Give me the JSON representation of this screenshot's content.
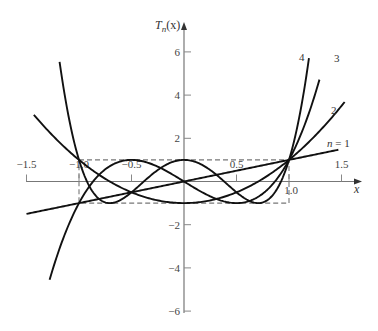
{
  "chart_data": {
    "type": "line",
    "title": "",
    "xlabel": "x",
    "ylabel": "T_n(x)",
    "xlim": [
      -1.5,
      1.5
    ],
    "ylim": [
      -6,
      6
    ],
    "grid": false,
    "x_ticks": [
      {
        "value": -1.5,
        "label": "−1.5"
      },
      {
        "value": -1.0,
        "label": "−1.0"
      },
      {
        "value": -0.5,
        "label": "−0.5"
      },
      {
        "value": 0.5,
        "label": "0.5"
      },
      {
        "value": 1.0,
        "label": "1.0"
      },
      {
        "value": 1.5,
        "label": "1.5"
      }
    ],
    "y_ticks": [
      {
        "value": 6,
        "label": "6"
      },
      {
        "value": 4,
        "label": "4"
      },
      {
        "value": 2,
        "label": "2"
      },
      {
        "value": -2,
        "label": "−2"
      },
      {
        "value": -4,
        "label": "−4"
      },
      {
        "value": -6,
        "label": "−6"
      }
    ],
    "reference_box": {
      "x": [
        -1,
        1
      ],
      "y": [
        -1,
        1
      ],
      "style": "dashed"
    },
    "series": [
      {
        "name": "n = 1",
        "label": "n = 1",
        "formula": "x",
        "x_range": [
          -1.5,
          1.47
        ]
      },
      {
        "name": "n = 2",
        "label": "2",
        "formula": "2x^2 - 1",
        "x_range": [
          -1.43,
          1.53
        ]
      },
      {
        "name": "n = 3",
        "label": "3",
        "formula": "4x^3 - 3x",
        "x_range": [
          -1.28,
          1.29
        ]
      },
      {
        "name": "n = 4",
        "label": "4",
        "formula": "8x^4 - 8x^2 + 1",
        "x_range": [
          -1.185,
          1.19
        ]
      }
    ]
  },
  "labels": {
    "y_axis": "T",
    "y_axis_sub": "n",
    "y_axis_tail": "(x)",
    "x_axis": "x",
    "n1_italic": "n",
    "n1_rest": " = 1",
    "n2": "2",
    "n3": "3",
    "n4": "4"
  }
}
